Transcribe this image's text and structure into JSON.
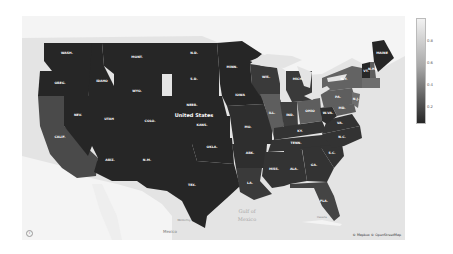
{
  "map": {
    "country_label": "United States",
    "water_labels": [
      "Gulf of",
      "Mexico"
    ],
    "land_labels": {
      "mexico": "Mexico",
      "monterrey": "Monterrey",
      "havana": "Havana"
    },
    "attribution": "© Mapbox © OpenStreetMap",
    "info_button": "i",
    "colors": {
      "water": "#e4e4e4",
      "land_other": "#f4f4f4",
      "state_darkest": "#262626",
      "state_dark": "#333333",
      "state_mid": "#4a4a4a",
      "state_mid_light": "#5e5e5e",
      "state_light": "#6e6e6e",
      "border": "#1e1e1e"
    }
  },
  "legend": {
    "ticks": [
      "0.8",
      "0.6",
      "0.4",
      "0.2"
    ],
    "range": [
      0.0,
      0.9
    ]
  },
  "states": [
    {
      "abbr": "WASH.",
      "value": 0.05
    },
    {
      "abbr": "OREG.",
      "value": 0.05
    },
    {
      "abbr": "CALIF.",
      "value": 0.25
    },
    {
      "abbr": "IDAHO",
      "value": 0.05
    },
    {
      "abbr": "NEV.",
      "value": 0.05
    },
    {
      "abbr": "MONT.",
      "value": 0.05
    },
    {
      "abbr": "WYO.",
      "value": 0.05
    },
    {
      "abbr": "UTAH",
      "value": 0.05
    },
    {
      "abbr": "ARIZ.",
      "value": 0.05
    },
    {
      "abbr": "COLO.",
      "value": 0.05
    },
    {
      "abbr": "N.M.",
      "value": 0.05
    },
    {
      "abbr": "N.D.",
      "value": 0.05
    },
    {
      "abbr": "S.D.",
      "value": 0.05
    },
    {
      "abbr": "NEBR.",
      "value": 0.05
    },
    {
      "abbr": "KANS.",
      "value": 0.05
    },
    {
      "abbr": "OKLA.",
      "value": 0.05
    },
    {
      "abbr": "TEX.",
      "value": 0.05
    },
    {
      "abbr": "MINN.",
      "value": 0.05
    },
    {
      "abbr": "IOWA",
      "value": 0.05
    },
    {
      "abbr": "MO.",
      "value": 0.08
    },
    {
      "abbr": "ARK.",
      "value": 0.08
    },
    {
      "abbr": "LA.",
      "value": 0.12
    },
    {
      "abbr": "WIS.",
      "value": 0.12
    },
    {
      "abbr": "ILL.",
      "value": 0.28
    },
    {
      "abbr": "MICH.",
      "value": 0.12
    },
    {
      "abbr": "IND.",
      "value": 0.14
    },
    {
      "abbr": "OHIO",
      "value": 0.28
    },
    {
      "abbr": "KY.",
      "value": 0.1
    },
    {
      "abbr": "TENN.",
      "value": 0.1
    },
    {
      "abbr": "MISS.",
      "value": 0.1
    },
    {
      "abbr": "ALA.",
      "value": 0.1
    },
    {
      "abbr": "GA.",
      "value": 0.1
    },
    {
      "abbr": "FLA.",
      "value": 0.18
    },
    {
      "abbr": "S.C.",
      "value": 0.1
    },
    {
      "abbr": "N.C.",
      "value": 0.1
    },
    {
      "abbr": "VA.",
      "value": 0.1
    },
    {
      "abbr": "W.VA.",
      "value": 0.08
    },
    {
      "abbr": "PA.",
      "value": 0.3
    },
    {
      "abbr": "N.Y.",
      "value": 0.32
    },
    {
      "abbr": "VT.",
      "value": 0.05
    },
    {
      "abbr": "MAINE",
      "value": 0.05
    },
    {
      "abbr": "N.H.",
      "value": 0.3
    },
    {
      "abbr": "MD.",
      "value": 0.3
    },
    {
      "abbr": "N.J.",
      "value": 0.35
    }
  ],
  "cities": [
    "Minneapolis",
    "St. Louis",
    "Chicago",
    "Dallas",
    "Phoenix",
    "Atlanta",
    "Denver",
    "Sacramento",
    "San Diego"
  ]
}
